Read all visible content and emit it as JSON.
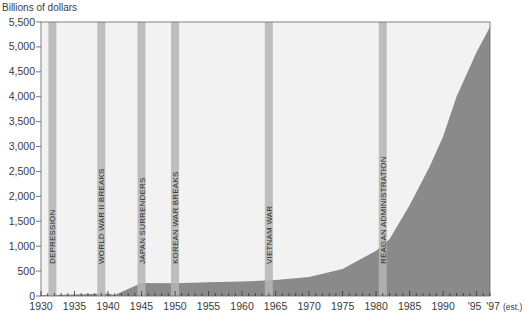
{
  "chart_data": {
    "type": "area",
    "title": "",
    "xlabel": "",
    "ylabel": "Billions of dollars",
    "xlim": [
      1930,
      1997
    ],
    "ylim": [
      0,
      5500
    ],
    "grid": false,
    "legend": null,
    "x_tick_labels": [
      "1930",
      "1935",
      "1940",
      "1945",
      "1950",
      "1955",
      "1960",
      "1965",
      "1970",
      "1975",
      "1980",
      "1985",
      "1990",
      "'95",
      "'97"
    ],
    "x_tick_note": "(est.)",
    "y_tick_labels": [
      "0",
      "500",
      "1,000",
      "1,500",
      "2,000",
      "2,500",
      "3,000",
      "3,500",
      "4,000",
      "4,500",
      "5,000",
      "5,500"
    ],
    "series": [
      {
        "name": "Federal debt (billions of dollars)",
        "x": [
          1930,
          1935,
          1939,
          1940,
          1941,
          1943,
          1945,
          1950,
          1955,
          1960,
          1965,
          1970,
          1975,
          1980,
          1982,
          1985,
          1988,
          1990,
          1992,
          1995,
          1997
        ],
        "values": [
          16,
          30,
          45,
          50,
          20,
          140,
          260,
          257,
          274,
          290,
          320,
          380,
          540,
          910,
          1140,
          1820,
          2600,
          3200,
          4000,
          4900,
          5400
        ]
      }
    ],
    "annotations": [
      {
        "label": "DEPRESSION",
        "year": 1931.7
      },
      {
        "label": "WORLD WAR II BREAKS",
        "year": 1939
      },
      {
        "label": "JAPAN SURRENDERS",
        "year": 1945
      },
      {
        "label": "KOREAN WAR BREAKS",
        "year": 1950
      },
      {
        "label": "VIETNAM WAR",
        "year": 1964
      },
      {
        "label": "REAGAN ADMINISTRATION",
        "year": 1981
      }
    ],
    "colors": {
      "area": "#8a8a8a",
      "background": "#f2f2f2",
      "event_bar": "#b5b5b5",
      "axis": "#555555"
    }
  }
}
